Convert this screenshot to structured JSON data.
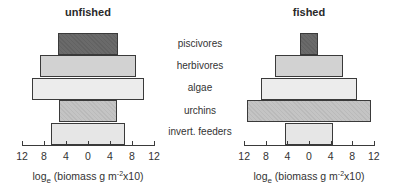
{
  "chart_data": [
    {
      "type": "bar",
      "orientation": "horizontal-symmetric (trophic pyramid)",
      "title": "unfished",
      "categories": [
        "piscivores",
        "herbivores",
        "algae",
        "urchins",
        "invert. feeders"
      ],
      "values": [
        5.4,
        8.7,
        10.1,
        5.3,
        6.7
      ],
      "xlabel": "loge (biomass g m-2x10)",
      "xticks": [
        "12",
        "8",
        "4",
        "0",
        "4",
        "8",
        "12"
      ],
      "xlim": [
        -12,
        12
      ],
      "grid": false,
      "fills": [
        "#6a6a6a",
        "#d2d2d2",
        "#ececec",
        "#c4c4c4",
        "#e6e6e6"
      ]
    },
    {
      "type": "bar",
      "orientation": "horizontal-symmetric (trophic pyramid)",
      "title": "fished",
      "categories": [
        "piscivores",
        "herbivores",
        "algae",
        "urchins",
        "invert. feeders"
      ],
      "values": [
        1.7,
        6.3,
        8.9,
        11.4,
        4.4
      ],
      "xlabel": "loge (biomass g m-2x10)",
      "xticks": [
        "12",
        "8",
        "4",
        "0",
        "4",
        "8",
        "12"
      ],
      "xlim": [
        -12,
        12
      ],
      "grid": false,
      "fills": [
        "#6a6a6a",
        "#d2d2d2",
        "#ececec",
        "#c4c4c4",
        "#e6e6e6"
      ]
    }
  ],
  "titles": {
    "left": "unfished",
    "right": "fished"
  },
  "labels": [
    "piscivores",
    "herbivores",
    "algae",
    "urchins",
    "invert. feeders"
  ],
  "ticks": [
    "12",
    "8",
    "4",
    "0",
    "4",
    "8",
    "12"
  ],
  "xlabel": {
    "base": "log",
    "sub": "e",
    "mid": " (biomass g m",
    "sup": "-2",
    "end": "x10)"
  }
}
